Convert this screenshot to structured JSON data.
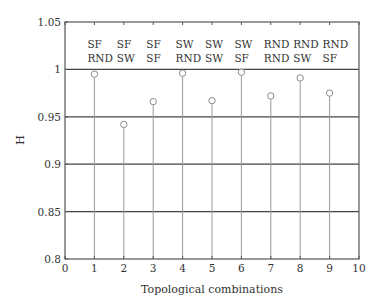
{
  "chart_data": {
    "type": "stem",
    "title": "",
    "xlabel": "Topological combinations",
    "ylabel": "H",
    "xlim": [
      0,
      10
    ],
    "ylim": [
      0.8,
      1.05
    ],
    "xticks": [
      "0",
      "1",
      "2",
      "3",
      "4",
      "5",
      "6",
      "7",
      "8",
      "9",
      "10"
    ],
    "yticks": [
      "0.8",
      "0.85",
      "0.9",
      "0.95",
      "1",
      "1.05"
    ],
    "grid": "horizontal",
    "x": [
      1,
      2,
      3,
      4,
      5,
      6,
      7,
      8,
      9
    ],
    "values": [
      0.995,
      0.942,
      0.966,
      0.996,
      0.967,
      0.997,
      0.972,
      0.991,
      0.975
    ],
    "annotations": [
      {
        "x": 1,
        "line1": "SF",
        "line2": "RND"
      },
      {
        "x": 2,
        "line1": "SF",
        "line2": "SW"
      },
      {
        "x": 3,
        "line1": "SF",
        "line2": "SF"
      },
      {
        "x": 4,
        "line1": "SW",
        "line2": "RND"
      },
      {
        "x": 5,
        "line1": "SW",
        "line2": "SW"
      },
      {
        "x": 6,
        "line1": "SW",
        "line2": "SF"
      },
      {
        "x": 7,
        "line1": "RND",
        "line2": "RND"
      },
      {
        "x": 8,
        "line1": "RND",
        "line2": "SW"
      },
      {
        "x": 9,
        "line1": "RND",
        "line2": "SF"
      }
    ],
    "colors": {
      "axis": "#555555",
      "grid": "#444444",
      "stem": "#9a9a9a",
      "marker": "#8a8a8a"
    }
  }
}
